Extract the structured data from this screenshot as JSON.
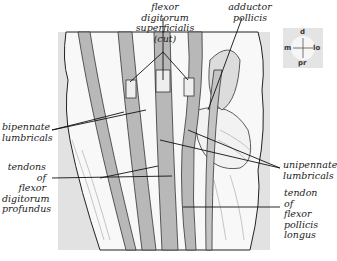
{
  "figure": {
    "labels": {
      "fds": [
        "flexor digitorum",
        "superficialis (cut)"
      ],
      "adductor": [
        "adductor",
        "pollicis"
      ],
      "bipennate": [
        "bipennate",
        "lumbricals"
      ],
      "fdp": [
        "tendons of",
        "flexor",
        "digitorum",
        "profundus"
      ],
      "unipennate": [
        "unipennate",
        "lumbricals"
      ],
      "fpl": [
        "tendon of",
        "flexor",
        "pollicis",
        "longus"
      ]
    },
    "compass": {
      "d": "d",
      "m": "m",
      "lo": "lo",
      "pr": "pr"
    },
    "colors": {
      "tendon": "#b8b8b8",
      "background": "#e2e2e2",
      "line": "#1a1a1a"
    }
  }
}
